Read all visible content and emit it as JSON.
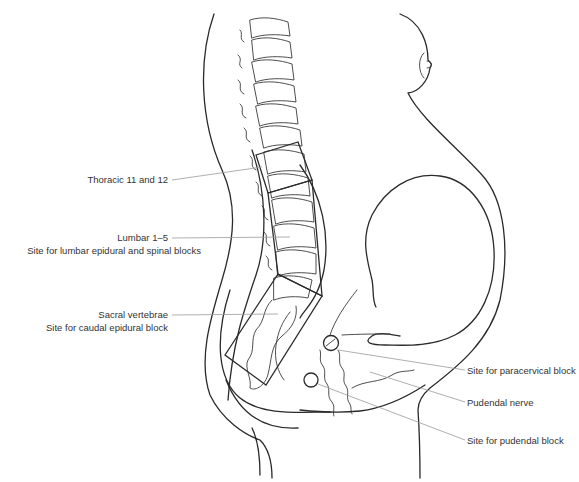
{
  "figure": {
    "line_color": "#2a2a2a",
    "leader_color": "#9a9a9a",
    "text_color": "#333333"
  },
  "labels": {
    "thoracic": "Thoracic 11 and 12",
    "lumbar_line1": "Lumbar 1–5",
    "lumbar_line2": "Site for lumbar epidural and spinal blocks",
    "sacral_line1": "Sacral vertebrae",
    "sacral_line2": "Site for caudal epidural block",
    "paracervical": "Site for paracervical block",
    "pudendal_nerve": "Pudendal nerve",
    "pudendal_block": "Site for pudendal block"
  }
}
